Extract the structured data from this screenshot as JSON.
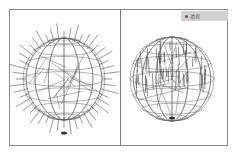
{
  "figure": {
    "left_panel": {
      "subject": "wireframe sphere with radial spikes",
      "icon": "spiked-wireframe-sphere"
    },
    "right_panel": {
      "subject": "wireframe sphere with vertical hair strands",
      "icon": "hairy-wireframe-sphere",
      "badge": {
        "label": "透视",
        "icon": "dot-icon"
      }
    }
  },
  "colors": {
    "frame": "#8a8a8a",
    "wire": "#555555",
    "badge_bg": "#d2d2d2"
  }
}
